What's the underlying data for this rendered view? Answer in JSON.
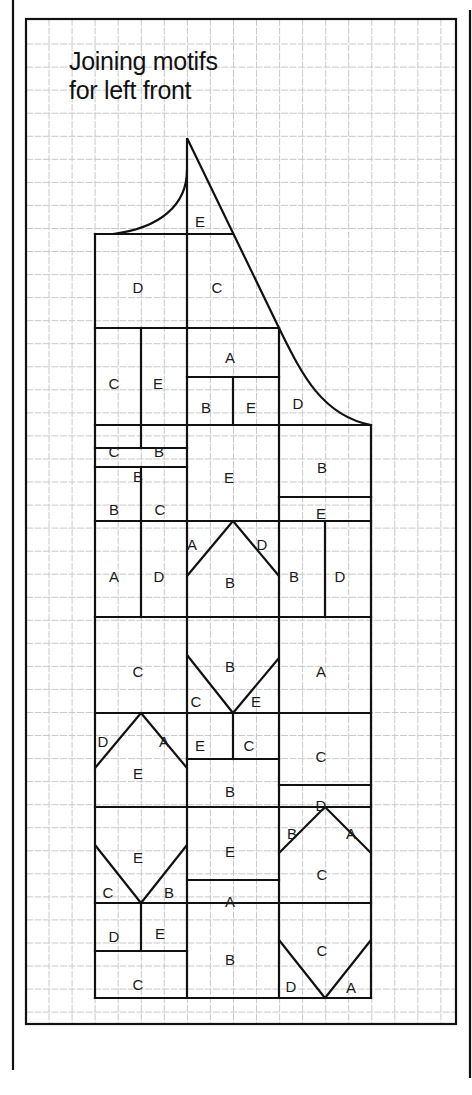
{
  "title": {
    "line1": "Joining motifs",
    "line2": "for left front"
  },
  "colors": {
    "ink": "#111111",
    "grid": "#c9c9c9",
    "paper": "#ffffff"
  },
  "frame": {
    "outer_left_x": 13,
    "outer_right_x": 470,
    "outer_top_y": 0,
    "outer_bottom_y": 1070,
    "inner": {
      "x": 26,
      "y": 19,
      "w": 430,
      "h": 1005
    },
    "grid": {
      "x0": 26,
      "y0": 21,
      "step": 23.05
    }
  },
  "pattern": {
    "outline_segments": [
      [
        95,
        234,
        95,
        998
      ],
      [
        95,
        998,
        371,
        998
      ],
      [
        371,
        998,
        371,
        425
      ],
      [
        187,
        234,
        187,
        998
      ],
      [
        279,
        328,
        279,
        998
      ],
      [
        95,
        234,
        233,
        234
      ],
      [
        95,
        328,
        279,
        328
      ],
      [
        95,
        425,
        371,
        425
      ],
      [
        95,
        521,
        371,
        521
      ],
      [
        95,
        617,
        371,
        617
      ],
      [
        95,
        713,
        371,
        713
      ],
      [
        95,
        807,
        371,
        807
      ],
      [
        95,
        903,
        371,
        903
      ],
      [
        141,
        328,
        141,
        425
      ],
      [
        187,
        377,
        279,
        377
      ],
      [
        233,
        377,
        233,
        425
      ],
      [
        141,
        425,
        141,
        448
      ],
      [
        95,
        448,
        187,
        448
      ],
      [
        95,
        467,
        187,
        467
      ],
      [
        141,
        467,
        141,
        521
      ],
      [
        279,
        497,
        371,
        497
      ],
      [
        141,
        521,
        141,
        617
      ],
      [
        325,
        521,
        325,
        617
      ],
      [
        233,
        713,
        233,
        759
      ],
      [
        187,
        759,
        279,
        759
      ],
      [
        279,
        785,
        371,
        785
      ],
      [
        187,
        880,
        279,
        880
      ],
      [
        141,
        903,
        141,
        951
      ],
      [
        95,
        951,
        187,
        951
      ]
    ],
    "diagonals": [
      [
        187,
        576,
        233,
        521
      ],
      [
        233,
        521,
        279,
        576
      ],
      [
        187,
        655,
        233,
        713
      ],
      [
        233,
        713,
        279,
        658
      ],
      [
        95,
        768,
        141,
        713
      ],
      [
        141,
        713,
        187,
        768
      ],
      [
        279,
        853,
        325,
        807
      ],
      [
        325,
        807,
        371,
        853
      ],
      [
        95,
        845,
        141,
        903
      ],
      [
        141,
        903,
        187,
        845
      ],
      [
        279,
        940,
        325,
        998
      ],
      [
        325,
        998,
        371,
        940
      ]
    ],
    "curves": {
      "neck": "M 113 234 C 160 228, 187 205, 187 170",
      "front_edge": "M 187 138 L 187 234 M 187 138 L 279 328",
      "armhole": "M 279 328 C 300 370, 320 415, 371 425"
    },
    "labels": [
      {
        "t": "E",
        "x": 200,
        "y": 222
      },
      {
        "t": "D",
        "x": 138,
        "y": 288
      },
      {
        "t": "C",
        "x": 217,
        "y": 288
      },
      {
        "t": "C",
        "x": 114,
        "y": 384
      },
      {
        "t": "E",
        "x": 158,
        "y": 384
      },
      {
        "t": "A",
        "x": 230,
        "y": 358
      },
      {
        "t": "B",
        "x": 206,
        "y": 408
      },
      {
        "t": "E",
        "x": 251,
        "y": 408
      },
      {
        "t": "D",
        "x": 298,
        "y": 404
      },
      {
        "t": "C",
        "x": 114,
        "y": 452
      },
      {
        "t": "B",
        "x": 159,
        "y": 452
      },
      {
        "t": "B",
        "x": 138,
        "y": 477
      },
      {
        "t": "B",
        "x": 114,
        "y": 510
      },
      {
        "t": "C",
        "x": 160,
        "y": 510
      },
      {
        "t": "E",
        "x": 229,
        "y": 478
      },
      {
        "t": "B",
        "x": 322,
        "y": 468
      },
      {
        "t": "E",
        "x": 321,
        "y": 514
      },
      {
        "t": "A",
        "x": 192,
        "y": 545
      },
      {
        "t": "D",
        "x": 262,
        "y": 545
      },
      {
        "t": "B",
        "x": 230,
        "y": 583
      },
      {
        "t": "A",
        "x": 114,
        "y": 577
      },
      {
        "t": "D",
        "x": 159,
        "y": 577
      },
      {
        "t": "B",
        "x": 294,
        "y": 577
      },
      {
        "t": "D",
        "x": 340,
        "y": 577
      },
      {
        "t": "C",
        "x": 138,
        "y": 672
      },
      {
        "t": "B",
        "x": 230,
        "y": 667
      },
      {
        "t": "A",
        "x": 321,
        "y": 672
      },
      {
        "t": "C",
        "x": 196,
        "y": 702
      },
      {
        "t": "E",
        "x": 256,
        "y": 702
      },
      {
        "t": "D",
        "x": 103,
        "y": 742
      },
      {
        "t": "A",
        "x": 164,
        "y": 742
      },
      {
        "t": "E",
        "x": 138,
        "y": 774
      },
      {
        "t": "E",
        "x": 200,
        "y": 746
      },
      {
        "t": "C",
        "x": 249,
        "y": 746
      },
      {
        "t": "B",
        "x": 230,
        "y": 792
      },
      {
        "t": "C",
        "x": 321,
        "y": 757
      },
      {
        "t": "D",
        "x": 321,
        "y": 806
      },
      {
        "t": "E",
        "x": 138,
        "y": 858
      },
      {
        "t": "E",
        "x": 230,
        "y": 852
      },
      {
        "t": "B",
        "x": 292,
        "y": 834
      },
      {
        "t": "A",
        "x": 351,
        "y": 834
      },
      {
        "t": "C",
        "x": 322,
        "y": 875
      },
      {
        "t": "C",
        "x": 108,
        "y": 893
      },
      {
        "t": "B",
        "x": 169,
        "y": 893
      },
      {
        "t": "A",
        "x": 230,
        "y": 902
      },
      {
        "t": "D",
        "x": 114,
        "y": 937
      },
      {
        "t": "E",
        "x": 160,
        "y": 934
      },
      {
        "t": "B",
        "x": 230,
        "y": 960
      },
      {
        "t": "C",
        "x": 138,
        "y": 985
      },
      {
        "t": "C",
        "x": 322,
        "y": 951
      },
      {
        "t": "D",
        "x": 291,
        "y": 987
      },
      {
        "t": "A",
        "x": 351,
        "y": 988
      }
    ]
  }
}
